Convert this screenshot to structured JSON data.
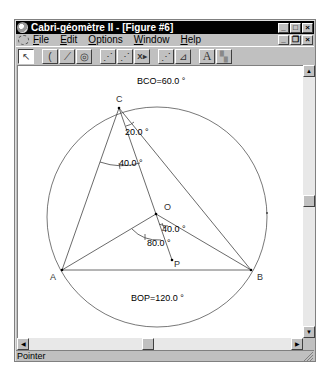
{
  "window": {
    "title": "Cabri-géomètre II - [Figure #6]",
    "controls": [
      "minimize",
      "maximize",
      "close"
    ]
  },
  "menubar": {
    "items": [
      {
        "label": "File",
        "accel": "F"
      },
      {
        "label": "Edit",
        "accel": "E"
      },
      {
        "label": "Options",
        "accel": "O"
      },
      {
        "label": "Window",
        "accel": "W"
      },
      {
        "label": "Help",
        "accel": "H"
      }
    ],
    "doc_controls": [
      "minimize",
      "restore",
      "close"
    ]
  },
  "toolbar": {
    "tools": [
      {
        "name": "pointer",
        "glyph": "↖",
        "active": true
      },
      {
        "name": "points",
        "glyph": "("
      },
      {
        "name": "lines",
        "glyph": "⟋"
      },
      {
        "name": "curves",
        "glyph": "◎"
      },
      {
        "name": "construct",
        "glyph": "⋰"
      },
      {
        "name": "transform",
        "glyph": "⋰"
      },
      {
        "name": "macro",
        "glyph": "X▸"
      },
      {
        "name": "check-property",
        "glyph": "⋰"
      },
      {
        "name": "measure",
        "glyph": "⊿"
      },
      {
        "name": "display",
        "glyph": "A"
      },
      {
        "name": "draw",
        "glyph": "▚"
      }
    ]
  },
  "figure": {
    "points": {
      "C": {
        "label": "C",
        "x": 101,
        "y": 42
      },
      "A": {
        "label": "A",
        "x": 44,
        "y": 204
      },
      "B": {
        "label": "B",
        "x": 233,
        "y": 204
      },
      "O": {
        "label": "O",
        "x": 138,
        "y": 148
      },
      "P": {
        "label": "P",
        "x": 154,
        "y": 194
      }
    },
    "circle": {
      "cx": 139,
      "cy": 151,
      "r": 110
    },
    "measurements": [
      {
        "id": "bco",
        "text": "BCO=60.0  °"
      },
      {
        "id": "angle-oCb",
        "text": "20.0  °"
      },
      {
        "id": "angle-acO",
        "text": "40.0  °"
      },
      {
        "id": "angle-bOp",
        "text": "40.0  °"
      },
      {
        "id": "angle-aOp",
        "text": "80.0  °"
      },
      {
        "id": "bop",
        "text": "BOP=120.0  °"
      }
    ]
  },
  "statusbar": {
    "text": "Pointer"
  },
  "scrollbars": {
    "vertical": {
      "up": "▲",
      "down": "▼",
      "thumb_pos": 0.5
    },
    "horizontal": {
      "left": "◀",
      "right": "▶",
      "thumb_pos": 0.45
    }
  }
}
